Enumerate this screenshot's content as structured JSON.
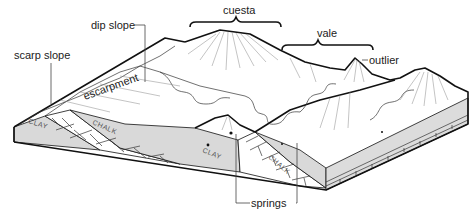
{
  "diagram": {
    "labels": {
      "cuesta": "cuesta",
      "vale": "vale",
      "outlier": "outlier",
      "dip_slope": "dip slope",
      "scarp_slope": "scarp slope",
      "escarpment": "escarpment",
      "springs": "springs"
    },
    "rock_layers": {
      "clay_left": "CLAY",
      "chalk_left": "CHALK",
      "clay_middle": "CLAY",
      "chalk_right": "CHALK"
    },
    "colors": {
      "line": "#111111",
      "clay_fill": "#d9d9d9",
      "chalk_fill": "#ffffff",
      "background": "#ffffff"
    }
  }
}
